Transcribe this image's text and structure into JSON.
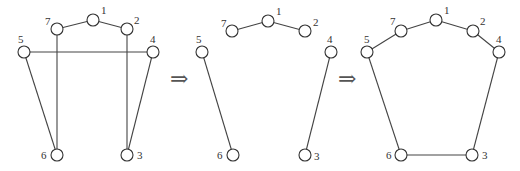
{
  "diagram": {
    "type": "graph-transformation",
    "arrow_symbol": "⇒",
    "panels": [
      {
        "id": "left",
        "nodes": [
          {
            "id": "1",
            "label": "1",
            "x": 93,
            "y": 20,
            "lx": 101,
            "ly": 14
          },
          {
            "id": "7",
            "label": "7",
            "x": 57,
            "y": 29,
            "lx": 45,
            "ly": 25
          },
          {
            "id": "2",
            "label": "2",
            "x": 127,
            "y": 29,
            "lx": 134,
            "ly": 24
          },
          {
            "id": "5",
            "label": "5",
            "x": 24,
            "y": 52,
            "lx": 18,
            "ly": 43
          },
          {
            "id": "4",
            "label": "4",
            "x": 153,
            "y": 52,
            "lx": 150,
            "ly": 43
          },
          {
            "id": "6",
            "label": "6",
            "x": 57,
            "y": 155,
            "lx": 41,
            "ly": 159
          },
          {
            "id": "3",
            "label": "3",
            "x": 127,
            "y": 155,
            "lx": 137,
            "ly": 159
          }
        ],
        "edges": [
          [
            "7",
            "1"
          ],
          [
            "1",
            "2"
          ],
          [
            "5",
            "4"
          ],
          [
            "7",
            "6"
          ],
          [
            "2",
            "3"
          ],
          [
            "5",
            "6"
          ],
          [
            "4",
            "3"
          ]
        ]
      },
      {
        "id": "middle",
        "nodes": [
          {
            "id": "1",
            "label": "1",
            "x": 268,
            "y": 21,
            "lx": 276,
            "ly": 15
          },
          {
            "id": "7",
            "label": "7",
            "x": 232,
            "y": 31,
            "lx": 221,
            "ly": 27
          },
          {
            "id": "2",
            "label": "2",
            "x": 305,
            "y": 31,
            "lx": 313,
            "ly": 26
          },
          {
            "id": "5",
            "label": "5",
            "x": 202,
            "y": 52,
            "lx": 196,
            "ly": 43
          },
          {
            "id": "4",
            "label": "4",
            "x": 331,
            "y": 52,
            "lx": 327,
            "ly": 43
          },
          {
            "id": "6",
            "label": "6",
            "x": 233,
            "y": 155,
            "lx": 217,
            "ly": 159
          },
          {
            "id": "3",
            "label": "3",
            "x": 305,
            "y": 155,
            "lx": 314,
            "ly": 160
          }
        ],
        "edges": [
          [
            "7",
            "1"
          ],
          [
            "1",
            "2"
          ],
          [
            "5",
            "6"
          ],
          [
            "4",
            "3"
          ]
        ]
      },
      {
        "id": "right",
        "nodes": [
          {
            "id": "1",
            "label": "1",
            "x": 436,
            "y": 20,
            "lx": 444,
            "ly": 14
          },
          {
            "id": "7",
            "label": "7",
            "x": 401,
            "y": 31,
            "lx": 390,
            "ly": 25
          },
          {
            "id": "2",
            "label": "2",
            "x": 473,
            "y": 31,
            "lx": 480,
            "ly": 25
          },
          {
            "id": "5",
            "label": "5",
            "x": 367,
            "y": 52,
            "lx": 364,
            "ly": 43
          },
          {
            "id": "4",
            "label": "4",
            "x": 499,
            "y": 52,
            "lx": 496,
            "ly": 43
          },
          {
            "id": "6",
            "label": "6",
            "x": 401,
            "y": 155,
            "lx": 386,
            "ly": 159
          },
          {
            "id": "3",
            "label": "3",
            "x": 472,
            "y": 155,
            "lx": 482,
            "ly": 159
          }
        ],
        "edges": [
          [
            "7",
            "1"
          ],
          [
            "1",
            "2"
          ],
          [
            "5",
            "7"
          ],
          [
            "2",
            "4"
          ],
          [
            "5",
            "6"
          ],
          [
            "4",
            "3"
          ],
          [
            "6",
            "3"
          ]
        ]
      }
    ],
    "arrows": [
      {
        "x": 170,
        "y": 86
      },
      {
        "x": 338,
        "y": 86
      }
    ]
  }
}
